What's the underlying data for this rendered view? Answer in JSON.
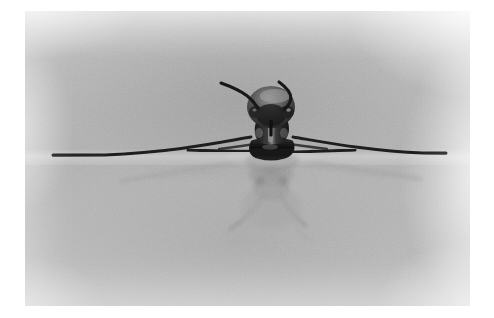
{
  "image": {
    "kind": "photograph",
    "subject_name": "water-strider-insect",
    "description": "Black-and-white photograph of a water strider standing on a still water surface, seen head-on, with its mirror reflection below the waterline.",
    "palette": {
      "paper_white": "#ffffff",
      "water_light": "#d5d5d5",
      "water_mid": "#b0b0b0",
      "water_dark": "#9d9d9d",
      "insect_black": "#1b1b1b",
      "insect_dark": "#2e2e2e",
      "insect_highlight": "#8f8f8f",
      "reflection_gray": "#8e8e8e",
      "reflection_faint": "#9f9f9f"
    },
    "frame": {
      "left": 25,
      "top": 11,
      "width": 445,
      "height": 295,
      "border_label": "white photographic margin"
    },
    "waterline_y": 146,
    "features": [
      {
        "name": "head",
        "label": "head with compound eyes",
        "x": 245,
        "y": 95
      },
      {
        "name": "antenna-left",
        "label": "left antenna",
        "tip_x": 220,
        "tip_y": 83
      },
      {
        "name": "antenna-right",
        "label": "right antenna",
        "tip_x": 279,
        "tip_y": 82
      },
      {
        "name": "thorax",
        "label": "thorax",
        "x": 246,
        "y": 126
      },
      {
        "name": "abdomen",
        "label": "abdomen",
        "x": 246,
        "y": 148
      },
      {
        "name": "foreleg-left",
        "label": "long left middle leg on water surface",
        "tip_x": 53,
        "tip_y": 155
      },
      {
        "name": "foreleg-right",
        "label": "long right middle leg on water surface",
        "tip_x": 445,
        "tip_y": 153
      },
      {
        "name": "midleg-left",
        "label": "short left foreleg",
        "tip_x": 188,
        "tip_y": 150
      },
      {
        "name": "midleg-right",
        "label": "short right foreleg",
        "tip_x": 312,
        "tip_y": 150
      },
      {
        "name": "reflection-body",
        "label": "reflected body below waterline",
        "x": 246,
        "y": 185
      },
      {
        "name": "reflection-leg-left",
        "label": "reflected hind leg pointing down-left",
        "tip_x": 213,
        "tip_y": 228
      },
      {
        "name": "reflection-leg-right",
        "label": "reflected hind leg pointing down-right",
        "tip_x": 282,
        "tip_y": 226
      },
      {
        "name": "reflection-leg-far-left",
        "label": "reflected long leg trailing left",
        "tip_x": 120,
        "tip_y": 172
      },
      {
        "name": "reflection-leg-far-right",
        "label": "reflected long leg trailing right",
        "tip_x": 372,
        "tip_y": 170
      }
    ]
  }
}
